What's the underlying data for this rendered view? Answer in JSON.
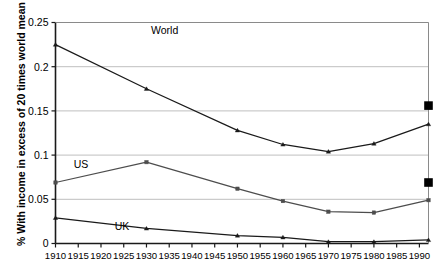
{
  "chart_data": {
    "type": "line",
    "title": "",
    "xlabel": "",
    "ylabel": "% With income in excess of 20 times world mean",
    "xlim": [
      1910,
      1992
    ],
    "ylim": [
      0,
      0.25
    ],
    "grid": true,
    "legend_position": "inline-labels",
    "x_ticks": [
      1910,
      1915,
      1920,
      1925,
      1930,
      1935,
      1940,
      1945,
      1950,
      1955,
      1960,
      1965,
      1970,
      1975,
      1980,
      1985,
      1990
    ],
    "x_tick_labels": [
      "1910",
      "1915",
      "1920",
      "1925",
      "1930",
      "1935",
      "1940",
      "1945",
      "1950",
      "1955",
      "1960",
      "1965",
      "1970",
      "1975",
      "1980",
      "1985",
      "1990"
    ],
    "y_ticks": [
      0,
      0.05,
      0.1,
      0.15,
      0.2,
      0.25
    ],
    "y_tick_labels": [
      "0",
      "0.05",
      "0.1",
      "0.15",
      "0.2",
      "0.25"
    ],
    "x": [
      1910,
      1930,
      1950,
      1960,
      1970,
      1980,
      1992
    ],
    "series": [
      {
        "name": "World",
        "label": "World",
        "marker": "triangle",
        "color": "#1a1a1a",
        "values": [
          0.225,
          0.175,
          0.128,
          0.112,
          0.104,
          0.113,
          0.135
        ],
        "label_x": 1931,
        "label_y": 0.2365
      },
      {
        "name": "US",
        "label": "US",
        "marker": "square",
        "color": "#4d4d4d",
        "values": [
          0.069,
          0.092,
          0.062,
          0.048,
          0.036,
          0.035,
          0.049
        ],
        "label_x": 1914,
        "label_y": 0.0855
      },
      {
        "name": "UK",
        "label": "UK",
        "marker": "triangle",
        "color": "#1a1a1a",
        "values": [
          0.029,
          0.017,
          0.009,
          0.007,
          0.002,
          0.002,
          0.004
        ],
        "label_x": 1923,
        "label_y": 0.0148
      }
    ],
    "endpoint_markers": [
      {
        "name": "world-endpoint",
        "x": 1992,
        "y": 0.156,
        "marker": "square",
        "color": "#000000"
      },
      {
        "name": "us-endpoint",
        "x": 1992,
        "y": 0.069,
        "marker": "square",
        "color": "#000000"
      }
    ],
    "colors": {
      "axis": "#1a1a1a",
      "gridline": "#bfbfbf",
      "plot_background": "#ffffff",
      "world_line": "#1a1a1a",
      "us_line": "#4d4d4d",
      "uk_line": "#1a1a1a",
      "endpoint_marker": "#000000"
    }
  }
}
